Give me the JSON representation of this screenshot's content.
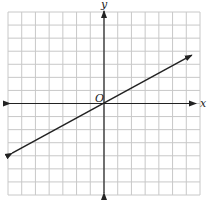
{
  "graph": {
    "axis_labels": {
      "x": "x",
      "y": "y",
      "origin": "O"
    },
    "grid": {
      "columns": 14,
      "rows": 14,
      "x_min": -7,
      "x_max": 7,
      "y_min": -7,
      "y_max": 7
    },
    "line": {
      "description": "Straight line through the origin with positive slope, arrows on both ends",
      "slope": 0.55,
      "intercept": 0,
      "from": [
        -6.7,
        -3.8
      ],
      "to": [
        6.4,
        3.7
      ]
    },
    "colors": {
      "grid": "#c8c8c8",
      "axis": "#222222",
      "line": "#222222",
      "background": "#ffffff"
    }
  }
}
